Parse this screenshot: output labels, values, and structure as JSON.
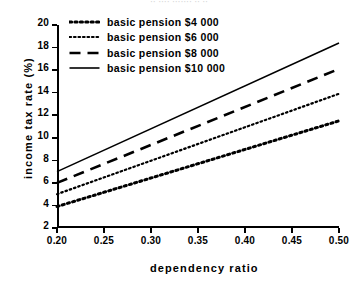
{
  "artifact_text": "·· ···· ······· ·· ··",
  "chart_data": {
    "type": "line",
    "title": "",
    "xlabel": "dependency  ratio",
    "ylabel": "income tax rate  (%)",
    "xlim": [
      0.2,
      0.5
    ],
    "ylim": [
      2,
      20
    ],
    "xticks": [
      "0.20",
      "0.25",
      "0.30",
      "0.35",
      "0.40",
      "0.45",
      "0.50"
    ],
    "xtick_values": [
      0.2,
      0.25,
      0.3,
      0.35,
      0.4,
      0.45,
      0.5
    ],
    "yticks": [
      "2",
      "4",
      "6",
      "8",
      "10",
      "12",
      "14",
      "16",
      "18",
      "20"
    ],
    "ytick_values": [
      2,
      4,
      6,
      8,
      10,
      12,
      14,
      16,
      18,
      20
    ],
    "grid": false,
    "legend_position": "upper-left-inside",
    "x": [
      0.2,
      0.5
    ],
    "series": [
      {
        "name": "basic  pension  $4 000",
        "style": "dotted-bold",
        "color": "#000000",
        "values": [
          3.9,
          11.5
        ]
      },
      {
        "name": "basic  pension  $6 000",
        "style": "dotted-fine",
        "color": "#000000",
        "values": [
          5.0,
          13.9
        ]
      },
      {
        "name": "basic  pension  $8 000",
        "style": "dashed",
        "color": "#000000",
        "values": [
          6.0,
          16.1
        ]
      },
      {
        "name": "basic  pension  $10 000",
        "style": "solid",
        "color": "#000000",
        "values": [
          7.0,
          18.4
        ]
      }
    ]
  },
  "legend": {
    "items": [
      {
        "label": "basic  pension  $4 000"
      },
      {
        "label": "basic  pension  $6 000"
      },
      {
        "label": "basic  pension  $8 000"
      },
      {
        "label": "basic  pension  $10 000"
      }
    ]
  }
}
